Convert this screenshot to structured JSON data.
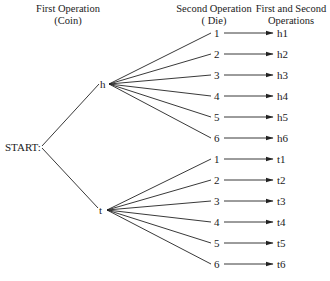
{
  "headers": {
    "first_operation": {
      "line1": "First Operation",
      "line2": "(Coin)"
    },
    "second_operation": {
      "line1": "Second Operation",
      "line2": "( Die)"
    },
    "combined": {
      "line1": "First and Second",
      "line2": "Operations"
    }
  },
  "root": {
    "label": "START:"
  },
  "coin_outcomes": [
    {
      "label": "h",
      "die": [
        {
          "face": "1",
          "result": "h1"
        },
        {
          "face": "2",
          "result": "h2"
        },
        {
          "face": "3",
          "result": "h3"
        },
        {
          "face": "4",
          "result": "h4"
        },
        {
          "face": "5",
          "result": "h5"
        },
        {
          "face": "6",
          "result": "h6"
        }
      ]
    },
    {
      "label": "t",
      "die": [
        {
          "face": "1",
          "result": "t1"
        },
        {
          "face": "2",
          "result": "t2"
        },
        {
          "face": "3",
          "result": "t3"
        },
        {
          "face": "4",
          "result": "t4"
        },
        {
          "face": "5",
          "result": "t5"
        },
        {
          "face": "6",
          "result": "t6"
        }
      ]
    }
  ],
  "colors": {
    "ink": "#1a1a1a",
    "background": "#ffffff"
  }
}
